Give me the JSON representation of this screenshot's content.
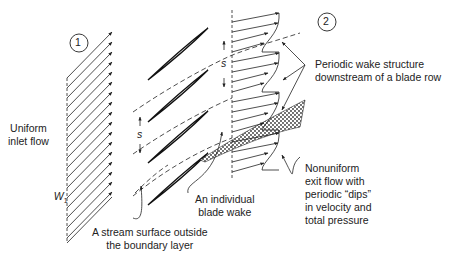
{
  "diagram": {
    "title": "Periodic wake structure downstream of a blade row",
    "stations": [
      {
        "id": "station-1",
        "label": "1"
      },
      {
        "id": "station-2",
        "label": "2"
      }
    ],
    "labels": {
      "inlet_flow": "Uniform\ninlet flow",
      "inlet_velocity_symbol": "W",
      "inlet_velocity_subscript": "1",
      "pitch_symbol": "s",
      "stream_surface": "A stream surface outside\nthe boundary layer",
      "blade_wake": "An individual\nblade wake",
      "periodic_wake": "Periodic wake structure\ndownstream of a blade row",
      "nonuniform_exit": "Nonuniform\nexit flow with\nperiodic “dips”\nin velocity and\ntotal pressure"
    },
    "blade_count": 4,
    "inlet_arrow_count": 17,
    "colors": {
      "line": "#222222",
      "background": "#ffffff",
      "wake_fill": "#555555"
    }
  }
}
